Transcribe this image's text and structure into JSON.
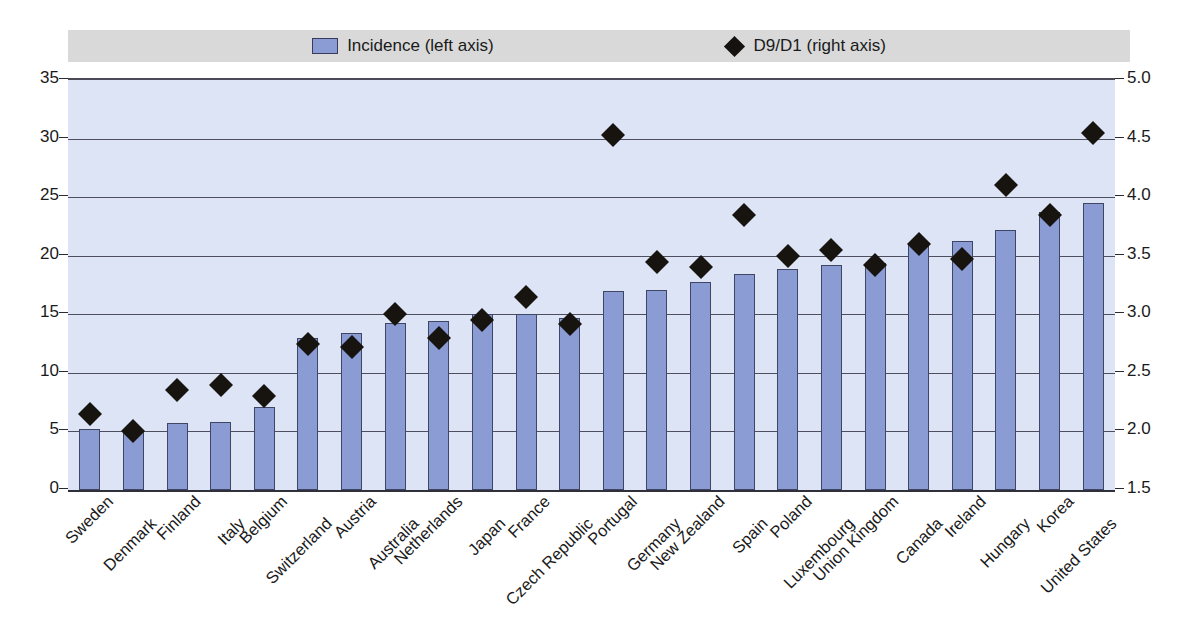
{
  "legend": {
    "items": [
      {
        "label": "Incidence (left axis)",
        "marker": "bar-swatch-icon",
        "color": "#8b9bd4"
      },
      {
        "label": "D9/D1 (right axis)",
        "marker": "diamond-icon",
        "color": "#17130f"
      }
    ]
  },
  "chart_data": {
    "type": "bar",
    "title": "",
    "subtitle": "",
    "xlabel": "",
    "ylabel": "",
    "grid": true,
    "legend_position": "top",
    "categories": [
      "Sweden",
      "Denmark",
      "Finland",
      "Italy",
      "Belgium",
      "Switzerland",
      "Austria",
      "Australia",
      "Netherlands",
      "Japan",
      "France",
      "Czech Republic",
      "Portugal",
      "Germany",
      "New Zealand",
      "Spain",
      "Poland",
      "Luxembourg",
      "Union Kingdom",
      "Canada",
      "Ireland",
      "Hungary",
      "Korea",
      "United States"
    ],
    "series": [
      {
        "name": "Incidence (left axis)",
        "type": "bar",
        "axis": "left",
        "color": "#8b9bd4",
        "values": [
          5.2,
          5.0,
          5.7,
          5.8,
          7.1,
          13.0,
          13.4,
          14.3,
          14.4,
          15.0,
          15.0,
          14.7,
          17.0,
          17.1,
          17.8,
          18.4,
          18.9,
          19.2,
          19.4,
          21.1,
          21.3,
          22.2,
          23.7,
          24.5
        ]
      },
      {
        "name": "D9/D1 (right axis)",
        "type": "scatter",
        "axis": "right",
        "color": "#17130f",
        "marker": "diamond",
        "values": [
          2.15,
          2.0,
          2.35,
          2.4,
          2.3,
          2.75,
          2.72,
          3.0,
          2.8,
          2.95,
          3.15,
          2.92,
          4.53,
          3.45,
          3.4,
          3.85,
          3.5,
          3.55,
          3.42,
          3.6,
          3.47,
          4.1,
          3.85,
          4.55
        ]
      }
    ],
    "left_axis": {
      "ticks": [
        "0",
        "5",
        "10",
        "15",
        "20",
        "25",
        "30",
        "35"
      ],
      "min": 0,
      "max": 35,
      "step": 5
    },
    "right_axis": {
      "ticks": [
        "1.5",
        "2.0",
        "2.5",
        "3.0",
        "3.5",
        "4.0",
        "4.5",
        "5.0"
      ],
      "min": 1.5,
      "max": 5.0,
      "step": 0.5
    }
  },
  "colors": {
    "plot_background": "#dce4f6",
    "legend_background": "#d9d9d9",
    "bar_fill": "#8b9bd4",
    "bar_edge": "#3f4663",
    "marker": "#17130f",
    "gridline": "#4e4e5e",
    "page_background": "#ffffff"
  }
}
